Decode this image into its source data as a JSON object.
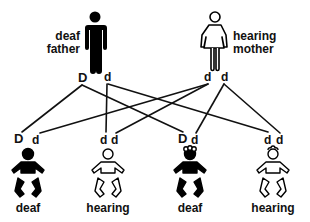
{
  "diagram": {
    "type": "genetic-inheritance-pedigree",
    "parents": [
      {
        "id": "father",
        "label_line1": "deaf",
        "label_line2": "father",
        "phenotype": "deaf",
        "figure": "male-solid",
        "alleles": [
          "D",
          "d"
        ],
        "color": "#000000"
      },
      {
        "id": "mother",
        "label_line1": "hearing",
        "label_line2": "mother",
        "phenotype": "hearing",
        "figure": "female-outline",
        "alleles": [
          "d",
          "d"
        ],
        "color": "#ffffff"
      }
    ],
    "children": [
      {
        "id": "child1",
        "label": "deaf",
        "alleles": [
          "D",
          "d"
        ],
        "figure": "baby-solid"
      },
      {
        "id": "child2",
        "label": "hearing",
        "alleles": [
          "d",
          "d"
        ],
        "figure": "baby-outline"
      },
      {
        "id": "child3",
        "label": "deaf",
        "alleles": [
          "D",
          "d"
        ],
        "figure": "baby-solid-curly"
      },
      {
        "id": "child4",
        "label": "hearing",
        "alleles": [
          "d",
          "d"
        ],
        "figure": "baby-outline-curly"
      }
    ],
    "connections": [
      {
        "from": "father.D",
        "to": "child1.D"
      },
      {
        "from": "father.D",
        "to": "child3.D"
      },
      {
        "from": "father.d",
        "to": "child2.d1"
      },
      {
        "from": "father.d",
        "to": "child4.d1"
      },
      {
        "from": "mother.d1",
        "to": "child1.d"
      },
      {
        "from": "mother.d1",
        "to": "child2.d2"
      },
      {
        "from": "mother.d2",
        "to": "child3.d"
      },
      {
        "from": "mother.d2",
        "to": "child4.d2"
      }
    ]
  }
}
